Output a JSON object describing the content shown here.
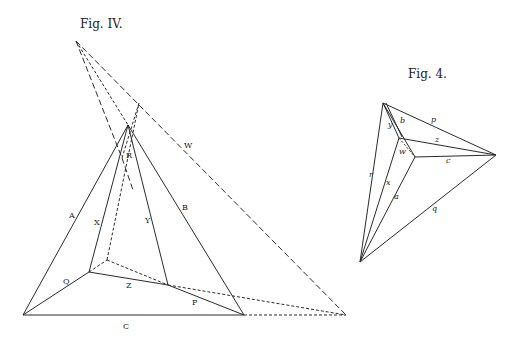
{
  "figures": [
    {
      "title": "Fig. IV.",
      "labels": {
        "A": "A",
        "B": "B",
        "C": "C",
        "P": "P",
        "Q": "Q",
        "R": "R",
        "W": "W",
        "X": "X",
        "Y": "Y",
        "Z": "Z"
      }
    },
    {
      "title": "Fig. 4.",
      "labels": {
        "p": "p",
        "q": "q",
        "r": "r",
        "a": "a",
        "b": "b",
        "c": "c",
        "x": "x",
        "y": "y",
        "z": "z",
        "w": "w"
      }
    }
  ],
  "colors": {
    "ink": "#2a2a2a",
    "paper": "#ffffff"
  }
}
